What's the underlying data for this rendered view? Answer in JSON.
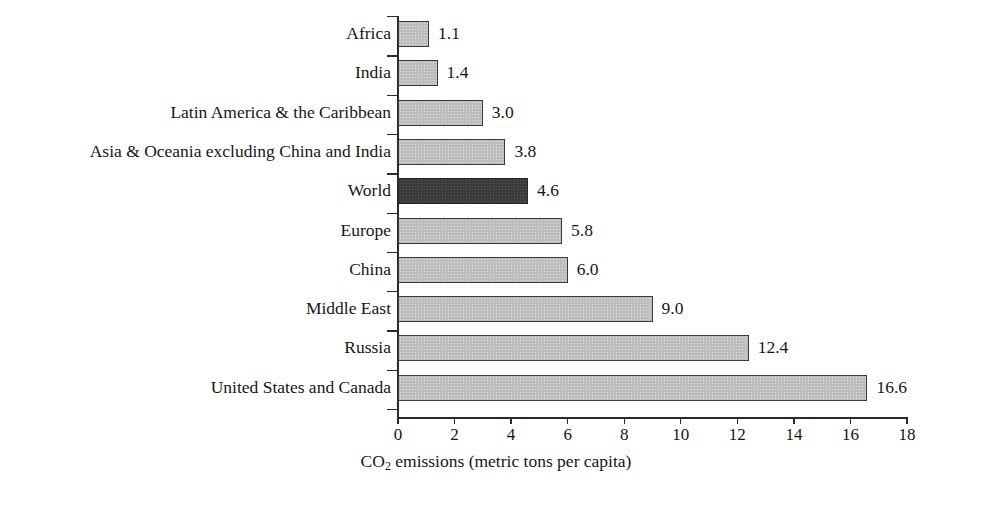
{
  "chart_data": {
    "type": "bar",
    "orientation": "horizontal",
    "title": "",
    "xlabel": "CO2 emissions (metric tons per capita)",
    "xlabel_parts": {
      "pre": "CO",
      "sub": "2",
      "post": " emissions (metric tons per capita)"
    },
    "ylabel": "",
    "xlim": [
      0,
      18
    ],
    "xticks": [
      0,
      2,
      4,
      6,
      8,
      10,
      12,
      14,
      16,
      18
    ],
    "xtick_labels": [
      "0",
      "2",
      "4",
      "6",
      "8",
      "10",
      "12",
      "14",
      "16",
      "18"
    ],
    "grid": false,
    "legend": false,
    "categories": [
      "Africa",
      "India",
      "Latin America & the Caribbean",
      "Asia & Oceania excluding China and India",
      "World",
      "Europe",
      "China",
      "Middle East",
      "Russia",
      "United States and Canada"
    ],
    "values": [
      1.1,
      1.4,
      3.0,
      3.8,
      4.6,
      5.8,
      6.0,
      9.0,
      12.4,
      16.6
    ],
    "value_labels": [
      "1.1",
      "1.4",
      "3.0",
      "3.8",
      "4.6",
      "5.8",
      "6.0",
      "9.0",
      "12.4",
      "16.6"
    ],
    "highlighted": [
      "World"
    ],
    "colors": {
      "bar_fill": "#bdbdbd",
      "bar_highlight_fill": "#3b3b3b",
      "bar_border": "#3a3a3a",
      "axis": "#2a2a2a",
      "text": "#161616",
      "background": "#ffffff"
    }
  }
}
